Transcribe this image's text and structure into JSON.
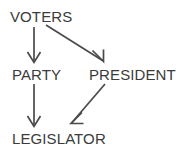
{
  "diagram": {
    "background_color": "#ffffff",
    "stroke_color": "#4a4a4a",
    "text_color": "#3b3b3b",
    "nodes": [
      {
        "id": "voters",
        "label": "VOTERS"
      },
      {
        "id": "party",
        "label": "PARTY"
      },
      {
        "id": "president",
        "label": "PRESIDENT"
      },
      {
        "id": "legislator",
        "label": "LEGISLATOR"
      }
    ],
    "edges": [
      {
        "id": "voters-party",
        "from": "VOTERS",
        "to": "PARTY",
        "direction": "down",
        "arrowhead": "open-v"
      },
      {
        "id": "voters-president",
        "from": "VOTERS",
        "to": "PRESIDENT",
        "direction": "down-right",
        "arrowhead": "open-v"
      },
      {
        "id": "party-legislator",
        "from": "PARTY",
        "to": "LEGISLATOR",
        "direction": "down",
        "arrowhead": "open-v"
      },
      {
        "id": "president-legislator",
        "from": "PRESIDENT",
        "to": "LEGISLATOR",
        "direction": "down-left",
        "arrowhead": "open-v"
      }
    ]
  }
}
